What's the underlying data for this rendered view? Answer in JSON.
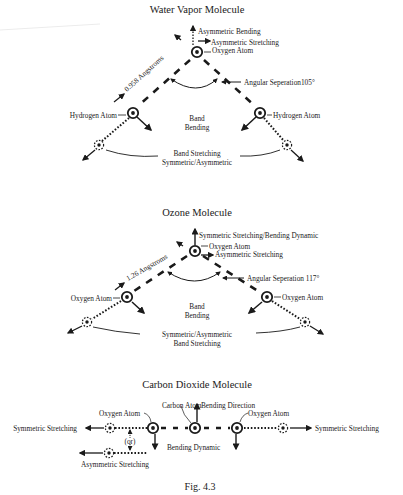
{
  "figure": {
    "caption": "Fig. 4.3",
    "colors": {
      "ink": "#1a1a1a",
      "background": "#ffffff"
    }
  },
  "water": {
    "title": "Water Vapor Molecule",
    "asym_bending": "Asymmetric Bending",
    "asym_stretching": "Asymmetric Stretching",
    "oxygen_atom": "Oxygen Atom",
    "bond_length": "0.958 Angstroms",
    "angular_sep": "Angular Seperation105°",
    "hydrogen_left": "Hydrogen Atom",
    "hydrogen_right": "Hydrogen Atom",
    "band_bending_1": "Band",
    "band_bending_2": "Bending",
    "band_stretch_1": "Band Stretching",
    "band_stretch_2": "Symmetric/Asymmetric"
  },
  "ozone": {
    "title": "Ozone Molecule",
    "sym_bending": "Symmetric Stretching/Bending Dynamic",
    "oxygen_top": "Oxygen Atom",
    "asym_stretching": "Asymmetric Stretching",
    "bond_length": "1.26  Angstroms",
    "angular_sep": "Angular Seperation 117°",
    "oxygen_left": "Oxygen Atom",
    "oxygen_right": "Oxygen Atom",
    "band_bending_1": "Band",
    "band_bending_2": "Bending",
    "band_stretch_1": "Symmetric/Asymmetric",
    "band_stretch_2": "Band Stretching"
  },
  "co2": {
    "title": "Carbon Dioxide Molecule",
    "carbon_atom": "Carbon Atom",
    "bending_direction": "Bending Direction",
    "oxygen_left": "Oxygen Atom",
    "oxygen_right": "Oxygen Atom",
    "sym_left": "Symmetric Stretching",
    "sym_right": "Symmetric Stretching",
    "or": "(or)",
    "bending_dynamic": "Bending Dynamic",
    "asym_stretching": "Asymmetric Stretching"
  }
}
